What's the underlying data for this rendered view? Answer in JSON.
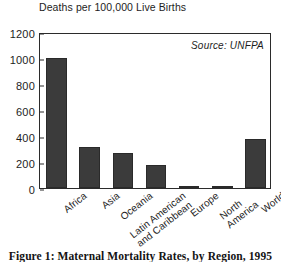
{
  "figure": {
    "caption": "Figure 1: Maternal Mortality Rates, by Region, 1995",
    "axis_title": "Deaths per\n100,000 Live Births",
    "source_note": "Source: UNFPA"
  },
  "chart_data": {
    "type": "bar",
    "title": "Deaths per 100,000 Live Births",
    "xlabel": "",
    "ylabel": "Deaths per 100,000 Live Births",
    "categories": [
      "Africa",
      "Asia",
      "Oceania",
      "Latin American\nand Caribbean",
      "Europe",
      "North America",
      "World"
    ],
    "values": [
      1000,
      315,
      270,
      180,
      18,
      8,
      380
    ],
    "ylim": [
      0,
      1200
    ],
    "yticks": [
      0,
      200,
      400,
      600,
      800,
      1000,
      1200
    ],
    "ytick_labels": [
      "0",
      "200",
      "400",
      "600",
      "800",
      "1000",
      "1200"
    ],
    "grid": false,
    "legend": "none",
    "annotations": [
      "Source: UNFPA"
    ],
    "bar_color": "#3b3b3b",
    "axis_color": "#2b2b2b"
  }
}
